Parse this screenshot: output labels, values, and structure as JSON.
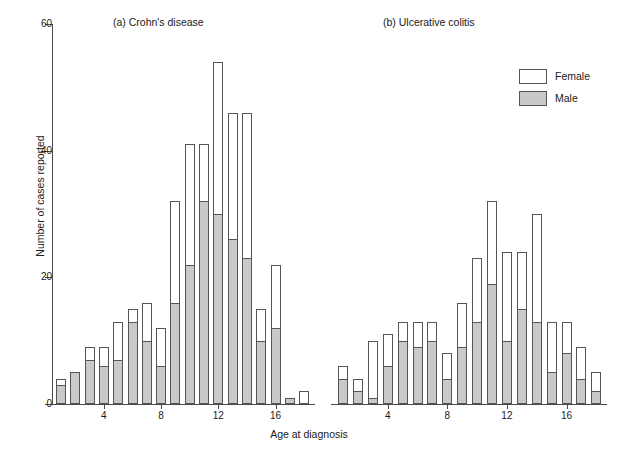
{
  "figure": {
    "width": 618,
    "height": 450,
    "x_axis_title": "Age at diagnosis",
    "y_axis_title": "Number of cases reported",
    "male_color": "#c9c9c9",
    "female_color": "#ffffff",
    "outline_color": "#555555"
  },
  "legend": {
    "position": "top-right",
    "entries": [
      {
        "label": "Female",
        "swatch": "white-box-swatch"
      },
      {
        "label": "Male",
        "swatch": "gray-box-swatch"
      }
    ]
  },
  "chart_data": [
    {
      "type": "bar",
      "stacked": true,
      "title": "(a) Crohn's disease",
      "xlabel": "Age at diagnosis",
      "ylabel": "Number of cases reported",
      "ylim": [
        0,
        60
      ],
      "yticks": [
        0,
        20,
        40,
        60
      ],
      "xticks": [
        4,
        8,
        12,
        16
      ],
      "grid": false,
      "categories": [
        1,
        2,
        3,
        4,
        5,
        6,
        7,
        8,
        9,
        10,
        11,
        12,
        13,
        14,
        15,
        16,
        17,
        18
      ],
      "series": [
        {
          "name": "Male",
          "values": [
            3,
            5,
            7,
            6,
            7,
            13,
            10,
            6,
            16,
            22,
            32,
            30,
            26,
            23,
            10,
            12,
            1,
            0
          ]
        },
        {
          "name": "Female",
          "values": [
            1,
            0,
            2,
            3,
            6,
            2,
            6,
            6,
            16,
            19,
            9,
            24,
            20,
            23,
            5,
            10,
            0,
            2
          ]
        }
      ],
      "totals": [
        4,
        5,
        9,
        9,
        13,
        15,
        16,
        12,
        32,
        41,
        41,
        54,
        46,
        46,
        15,
        22,
        1,
        2
      ]
    },
    {
      "type": "bar",
      "stacked": true,
      "title": "(b) Ulcerative colitis",
      "xlabel": "Age at diagnosis",
      "ylabel": "Number of cases reported",
      "ylim": [
        0,
        60
      ],
      "yticks": [
        0,
        20,
        40,
        60
      ],
      "xticks": [
        4,
        8,
        12,
        16
      ],
      "grid": false,
      "categories": [
        1,
        2,
        3,
        4,
        5,
        6,
        7,
        8,
        9,
        10,
        11,
        12,
        13,
        14,
        15,
        16,
        17,
        18
      ],
      "series": [
        {
          "name": "Male",
          "values": [
            4,
            2,
            1,
            6,
            10,
            9,
            10,
            4,
            9,
            13,
            19,
            10,
            15,
            13,
            5,
            8,
            4,
            2
          ]
        },
        {
          "name": "Female",
          "values": [
            2,
            2,
            9,
            5,
            3,
            4,
            3,
            4,
            7,
            10,
            13,
            14,
            9,
            17,
            8,
            5,
            5,
            3
          ]
        }
      ],
      "totals": [
        6,
        4,
        10,
        11,
        13,
        13,
        13,
        8,
        16,
        23,
        32,
        24,
        30,
        25,
        13,
        13,
        9,
        5
      ]
    }
  ]
}
